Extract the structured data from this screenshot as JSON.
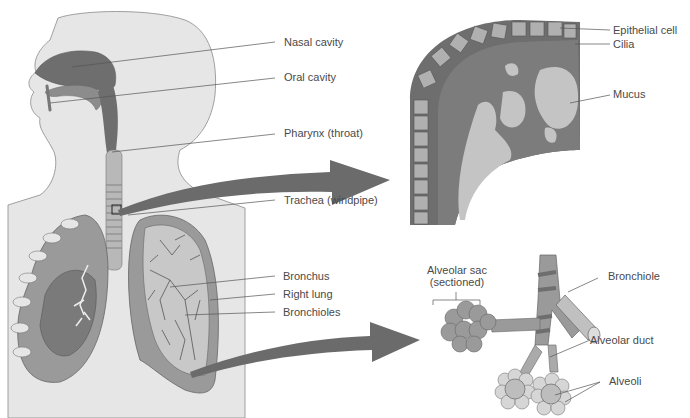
{
  "diagram": {
    "body_labels": {
      "nasal_cavity": "Nasal cavity",
      "oral_cavity": "Oral cavity",
      "pharynx": "Pharynx (throat)",
      "trachea": "Trachea (windpipe)",
      "bronchus": "Bronchus",
      "right_lung": "Right lung",
      "bronchioles": "Bronchioles"
    },
    "epithelium_inset": {
      "epithelial_cell": "Epithelial cell",
      "cilia": "Cilia",
      "mucus": "Mucus"
    },
    "alveoli_inset": {
      "alveolar_sac_line1": "Alveolar sac",
      "alveolar_sac_line2": "(sectioned)",
      "bronchiole": "Bronchiole",
      "alveolar_duct": "Alveolar duct",
      "alveoli": "Alveoli"
    },
    "colors": {
      "skin": "#e6e6e6",
      "outline": "#777777",
      "airway_dark": "#6e6e6e",
      "tissue_mid": "#9a9a9a",
      "tissue_light": "#c8c8c8",
      "arrow": "#6b6b6b",
      "label_text": "#4a4a4a",
      "leader_line": "#555555"
    }
  }
}
